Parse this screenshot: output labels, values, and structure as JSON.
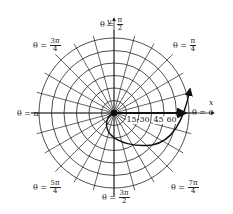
{
  "diagram": {
    "type": "polar-grid-with-spiral",
    "center": {
      "x": 114,
      "y": 113
    },
    "outer_radius": 75,
    "circle_count": 6,
    "radial_line_step_deg": 15,
    "colors": {
      "grid": "#222222",
      "curve": "#111111",
      "background": "#ffffff"
    },
    "axes": {
      "x_label": "x",
      "y_label": "y"
    },
    "angle_labels": [
      {
        "id": "theta-0",
        "prefix": "θ = ",
        "value": "0",
        "num": "",
        "den": "",
        "x": 192,
        "y": 109
      },
      {
        "id": "theta-pi-4",
        "prefix": "θ = ",
        "num": "π",
        "den": "4",
        "x": 173,
        "y": 38
      },
      {
        "id": "theta-pi-2",
        "prefix": "θ = ",
        "num": "π",
        "den": "2",
        "x": 100,
        "y": 17
      },
      {
        "id": "theta-3pi-4",
        "prefix": "θ = ",
        "num": "3π",
        "den": "4",
        "x": 33,
        "y": 38
      },
      {
        "id": "theta-pi",
        "prefix": "θ = ",
        "value": "π",
        "num": "",
        "den": "",
        "x": 17,
        "y": 110
      },
      {
        "id": "theta-5pi-4",
        "prefix": "θ = ",
        "num": "5π",
        "den": "4",
        "x": 33,
        "y": 180
      },
      {
        "id": "theta-3pi-2",
        "prefix": "θ = ",
        "num": "3π",
        "den": "2",
        "x": 102,
        "y": 190
      },
      {
        "id": "theta-7pi-4",
        "prefix": "θ = ",
        "num": "7π",
        "den": "4",
        "x": 171,
        "y": 180
      }
    ],
    "radial_ticks": [
      {
        "label": "15",
        "x": 126,
        "y": 116
      },
      {
        "label": "30",
        "x": 139,
        "y": 116
      },
      {
        "label": "45",
        "x": 153,
        "y": 116
      },
      {
        "label": "60",
        "x": 166,
        "y": 116
      }
    ]
  }
}
